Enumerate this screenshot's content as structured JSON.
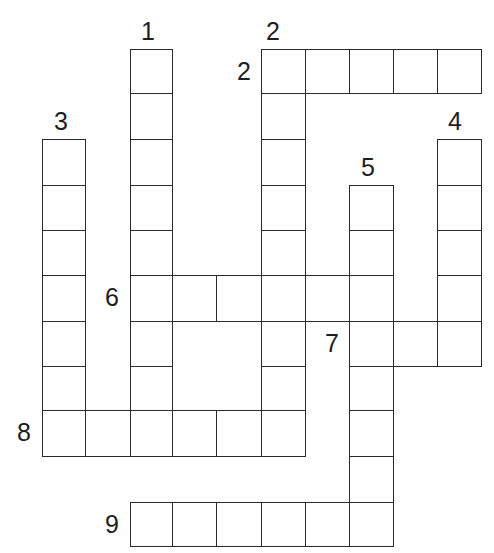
{
  "puzzle": {
    "type": "crossword",
    "colors": {
      "line": "#2a2a2a",
      "background": "#ffffff",
      "label": "#1e1e1e"
    },
    "grid": {
      "col_x": [
        42,
        85,
        130,
        172,
        216,
        261,
        305,
        349,
        393,
        437,
        481
      ],
      "row_y": [
        49,
        93,
        139,
        185,
        230,
        275,
        321,
        366,
        410,
        456,
        502,
        546
      ]
    },
    "entries": [
      {
        "number": "1",
        "direction": "down",
        "row": 0,
        "col": 2,
        "length": 9
      },
      {
        "number": "2",
        "direction": "across",
        "row": 0,
        "col": 5,
        "length": 5
      },
      {
        "number": "2",
        "direction": "down",
        "row": 0,
        "col": 5,
        "length": 9
      },
      {
        "number": "3",
        "direction": "down",
        "row": 2,
        "col": 0,
        "length": 7
      },
      {
        "number": "4",
        "direction": "down",
        "row": 2,
        "col": 9,
        "length": 5
      },
      {
        "number": "5",
        "direction": "down",
        "row": 3,
        "col": 7,
        "length": 8
      },
      {
        "number": "6",
        "direction": "across",
        "row": 5,
        "col": 2,
        "length": 6
      },
      {
        "number": "7",
        "direction": "across",
        "row": 6,
        "col": 7,
        "length": 3
      },
      {
        "number": "8",
        "direction": "across",
        "row": 8,
        "col": 0,
        "length": 6
      },
      {
        "number": "9",
        "direction": "across",
        "row": 10,
        "col": 2,
        "length": 6
      }
    ],
    "labels": [
      {
        "text": "1",
        "x": 141,
        "y": 19
      },
      {
        "text": "2",
        "x": 266,
        "y": 19
      },
      {
        "text": "2",
        "x": 237,
        "y": 59
      },
      {
        "text": "3",
        "x": 54,
        "y": 109
      },
      {
        "text": "4",
        "x": 448,
        "y": 109
      },
      {
        "text": "5",
        "x": 361,
        "y": 155
      },
      {
        "text": "6",
        "x": 105,
        "y": 285
      },
      {
        "text": "7",
        "x": 325,
        "y": 331
      },
      {
        "text": "8",
        "x": 17,
        "y": 420
      },
      {
        "text": "9",
        "x": 105,
        "y": 512
      }
    ]
  }
}
